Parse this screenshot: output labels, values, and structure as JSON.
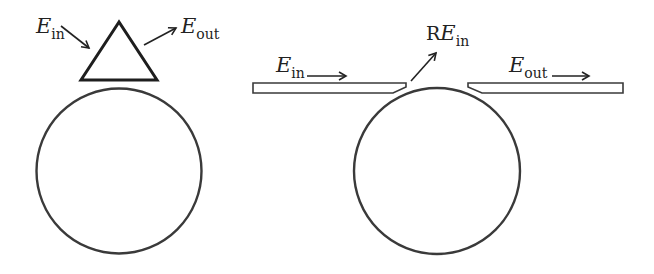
{
  "diagram": {
    "title": "",
    "colors": {
      "stroke": "#3a3a3a",
      "triangle_stroke": "#1e1e1e",
      "text": "#222222",
      "background": "#ffffff"
    },
    "left_panel": {
      "description": "Prism-coupled ring resonator",
      "input_label": {
        "symbol": "E",
        "subscript": "in"
      },
      "output_label": {
        "symbol": "E",
        "subscript": "out"
      },
      "components": [
        "prism-triangle",
        "ring-resonator"
      ]
    },
    "right_panel": {
      "description": "Waveguide-coupled ring resonator with reflection",
      "input_label": {
        "symbol": "E",
        "subscript": "in"
      },
      "reflected_label": {
        "prefix": "R",
        "symbol": "E",
        "subscript": "in"
      },
      "output_label": {
        "symbol": "E",
        "subscript": "out"
      },
      "components": [
        "input-waveguide",
        "output-waveguide",
        "ring-resonator"
      ]
    }
  }
}
